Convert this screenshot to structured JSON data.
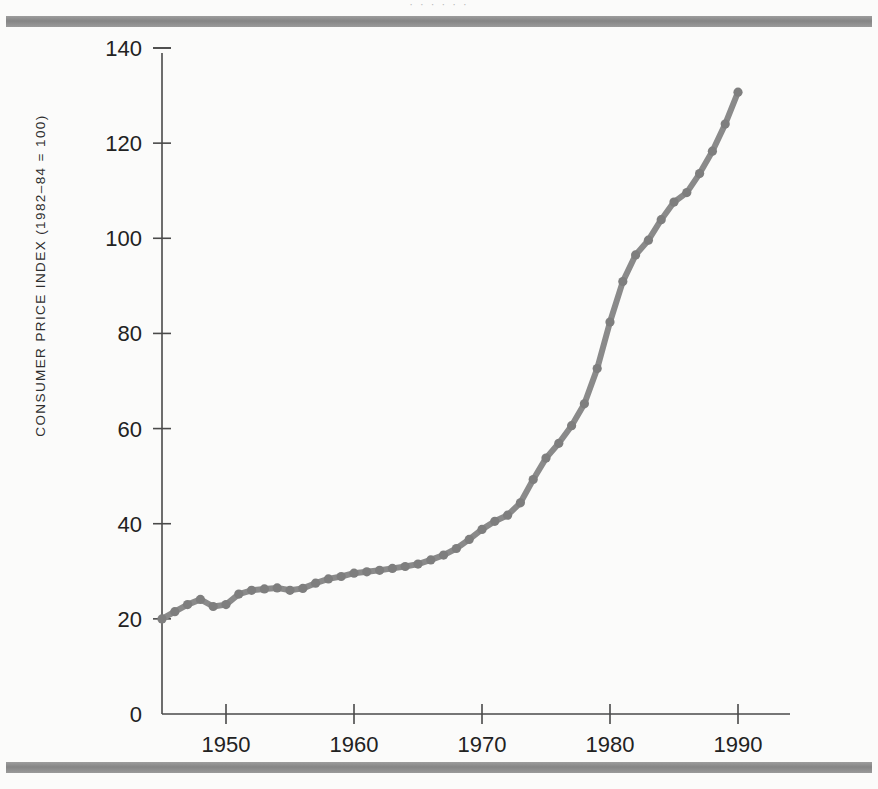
{
  "page": {
    "background_color": "#fbfbfa",
    "rule_color": "#8d8d8d",
    "top_bleed_text": "· ·   ·        ·                 ·          ·"
  },
  "chart_data": {
    "type": "line",
    "title": "",
    "xlabel": "",
    "ylabel": "CONSUMER PRICE INDEX (1982–84 = 100)",
    "xlim": [
      1944,
      1994
    ],
    "ylim": [
      0,
      140
    ],
    "xticks": [
      1950,
      1960,
      1970,
      1980,
      1990
    ],
    "xticklabels": [
      "1950",
      "1960",
      "1970",
      "1980",
      "1990"
    ],
    "yticks": [
      0,
      20,
      40,
      60,
      80,
      100,
      120,
      140
    ],
    "yticklabels": [
      "0",
      "20",
      "40",
      "60",
      "80",
      "100",
      "120",
      "140"
    ],
    "grid": false,
    "legend": null,
    "line_color": "#8a8a8a",
    "marker": "circle",
    "series": [
      {
        "name": "Consumer Price Index",
        "x": [
          1945,
          1946,
          1947,
          1948,
          1949,
          1950,
          1951,
          1952,
          1953,
          1954,
          1955,
          1956,
          1957,
          1958,
          1959,
          1960,
          1961,
          1962,
          1963,
          1964,
          1965,
          1966,
          1967,
          1968,
          1969,
          1970,
          1971,
          1972,
          1973,
          1974,
          1975,
          1976,
          1977,
          1978,
          1979,
          1980,
          1981,
          1982,
          1983,
          1984,
          1985,
          1986,
          1987,
          1988,
          1989,
          1990
        ],
        "values": [
          20.0,
          21.5,
          23.0,
          24.1,
          22.6,
          23.0,
          25.2,
          26.0,
          26.3,
          26.5,
          26.0,
          26.4,
          27.5,
          28.4,
          28.9,
          29.6,
          29.9,
          30.2,
          30.6,
          31.0,
          31.5,
          32.4,
          33.4,
          34.8,
          36.7,
          38.8,
          40.5,
          41.8,
          44.4,
          49.3,
          53.8,
          56.9,
          60.6,
          65.2,
          72.6,
          82.4,
          90.9,
          96.5,
          99.6,
          103.9,
          107.6,
          109.6,
          113.6,
          118.3,
          124.0,
          130.7
        ]
      }
    ]
  }
}
